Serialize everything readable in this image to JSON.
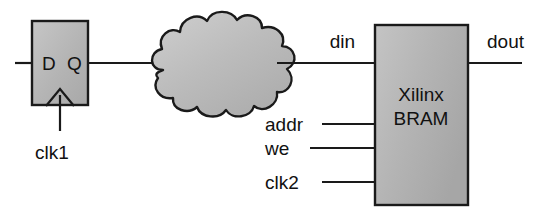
{
  "diagram": {
    "type": "block-diagram",
    "background_color": "#ffffff",
    "wire_color": "#1a1a1a",
    "outline_color": "#1a1a1a",
    "text_color": "#111111",
    "flipflop": {
      "name": "D flip-flop",
      "fill_color": "#b5b5b5",
      "d_port_label": "D",
      "q_port_label": "Q",
      "clock_label": "clk1",
      "clock_edge_symbol": "triangle",
      "x": 32,
      "y": 21,
      "width": 56,
      "height": 84
    },
    "cloud": {
      "name": "combinational logic cloud",
      "fill_color": "#bdbdbd",
      "label": "",
      "bump_count": 12,
      "center_x": 209,
      "center_y": 64
    },
    "bram": {
      "name": "Xilinx BRAM block",
      "fill_color": "#b5b5b5",
      "label_line1": "Xilinx",
      "label_line2": "BRAM",
      "x": 375,
      "y": 25,
      "width": 93,
      "height": 180
    },
    "signals": [
      {
        "name": "din",
        "label": "din",
        "direction": "input",
        "y": 63,
        "label_x": 355,
        "label_y": 48,
        "label_anchor": "end"
      },
      {
        "name": "addr",
        "label": "addr",
        "direction": "input",
        "y": 124,
        "label_x": 265,
        "label_y": 131,
        "label_anchor": "start"
      },
      {
        "name": "we",
        "label": "we",
        "direction": "input",
        "y": 148,
        "label_x": 265,
        "label_y": 155,
        "label_anchor": "start"
      },
      {
        "name": "clk2",
        "label": "clk2",
        "direction": "input",
        "y": 182,
        "label_x": 265,
        "label_y": 189,
        "label_anchor": "start"
      },
      {
        "name": "dout",
        "label": "dout",
        "direction": "output",
        "y": 63,
        "label_x": 487,
        "label_y": 48,
        "label_anchor": "start"
      }
    ]
  }
}
